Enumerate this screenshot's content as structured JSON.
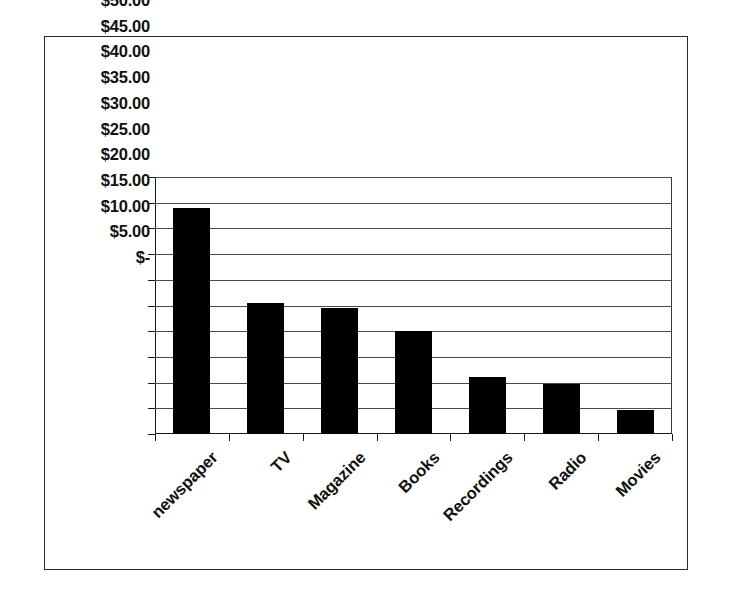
{
  "figure": {
    "background_color": "#ffffff",
    "frame_color": "#2a2a2a",
    "bar_color": "#000000",
    "axis_color": "#1a1a1a",
    "gridline_color": "#4a4a4a"
  },
  "chart_data": {
    "type": "bar",
    "title": "",
    "subtitle": "",
    "xlabel": "",
    "ylabel": "",
    "categories": [
      "newspaper",
      "TV",
      "Magazine",
      "Books",
      "Recordings",
      "Radio",
      "Movies"
    ],
    "values": [
      44.0,
      25.5,
      24.5,
      20.0,
      11.0,
      9.8,
      4.6
    ],
    "ylim": [
      0,
      50
    ],
    "ytick_values": [
      50,
      45,
      40,
      35,
      30,
      25,
      20,
      15,
      10,
      5,
      0
    ],
    "ytick_labels": [
      "$50.00",
      "$45.00",
      "$40.00",
      "$35.00",
      "$30.00",
      "$25.00",
      "$20.00",
      "$15.00",
      "$10.00",
      "$5.00",
      "$-"
    ],
    "grid": true,
    "grid_axis": "y",
    "legend": false,
    "legend_position": "none",
    "orientation": "vertical",
    "xtick_label_rotation": -45,
    "annotations": []
  }
}
